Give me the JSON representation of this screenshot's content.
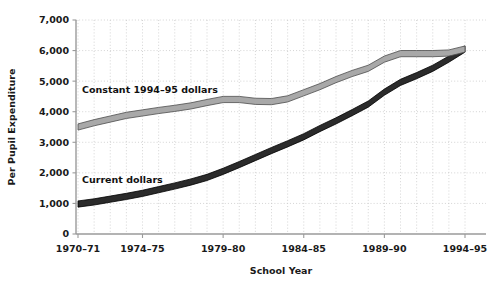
{
  "chart_data": {
    "type": "line",
    "title": "",
    "xlabel": "School Year",
    "ylabel": "Per Pupil Expenditure",
    "xlim": [
      1970,
      1994
    ],
    "ylim": [
      0,
      7000
    ],
    "grid": true,
    "legend_position": "inline-labels",
    "x_tick_labels": [
      "1970–71",
      "1974–75",
      "1979–80",
      "1984–85",
      "1989–90",
      "1994–95"
    ],
    "x_tick_values": [
      1970,
      1974,
      1979,
      1984,
      1989,
      1994
    ],
    "y_tick_labels": [
      "0",
      "1,000",
      "2,000",
      "3,000",
      "4,000",
      "5,000",
      "6,000",
      "7,000"
    ],
    "y_tick_values": [
      0,
      1000,
      2000,
      3000,
      4000,
      5000,
      6000,
      7000
    ],
    "x": [
      1970,
      1971,
      1972,
      1973,
      1974,
      1975,
      1976,
      1977,
      1978,
      1979,
      1980,
      1981,
      1982,
      1983,
      1984,
      1985,
      1986,
      1987,
      1988,
      1989,
      1990,
      1991,
      1992,
      1993,
      1994
    ],
    "series": [
      {
        "name": "Constant 1994–95 dollars",
        "color": "#a8a8a8",
        "edge_color": "#4d4d4d",
        "values": [
          3500,
          3640,
          3760,
          3880,
          3960,
          4040,
          4110,
          4190,
          4300,
          4400,
          4400,
          4340,
          4330,
          4420,
          4620,
          4820,
          5050,
          5250,
          5420,
          5720,
          5900,
          5900,
          5900,
          5920,
          6050
        ]
      },
      {
        "name": "Current dollars",
        "color": "#2b2b2b",
        "edge_color": "#000000",
        "values": [
          980,
          1050,
          1140,
          1230,
          1330,
          1450,
          1570,
          1700,
          1850,
          2050,
          2270,
          2500,
          2730,
          2950,
          3180,
          3450,
          3700,
          3970,
          4250,
          4640,
          4960,
          5180,
          5420,
          5720,
          6050
        ]
      }
    ],
    "annotations": [
      {
        "text": "Constant 1994–95 dollars",
        "x_px": 82,
        "y_px": 93
      },
      {
        "text": "Current dollars",
        "x_px": 82,
        "y_px": 183
      }
    ]
  },
  "colors": {
    "background": "#ffffff",
    "axis": "#9a9a9a",
    "grid": "#c9c9c9",
    "text": "#1a1a1a",
    "constant_band": "#a8a8a8",
    "current_band": "#2b2b2b"
  }
}
